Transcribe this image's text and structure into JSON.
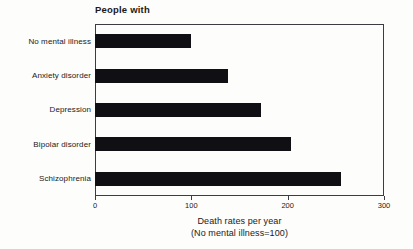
{
  "chart_data": {
    "type": "bar",
    "orientation": "horizontal",
    "title": "People with",
    "categories": [
      "No mental illness",
      "Anxiety disorder",
      "Depression",
      "Bipolar disorder",
      "Schizophrenia"
    ],
    "values": [
      100,
      138,
      172,
      203,
      255
    ],
    "series": [
      {
        "name": "Death rates per year",
        "values": [
          100,
          138,
          172,
          203,
          255
        ]
      }
    ],
    "xlabel": "Death rates per year",
    "xlabel_sub": "(No mental illness=100)",
    "ylabel": "",
    "xlim": [
      0,
      300
    ],
    "xticks": [
      0,
      100,
      200,
      300
    ],
    "xtick_labels": [
      "0",
      "100",
      "200",
      "300"
    ],
    "grid": false,
    "legend": "none",
    "bar_color": "#101014",
    "frame_color": "#3c3c44",
    "background_color": "#fdfdfc",
    "text_color": "#1a1a1a"
  }
}
